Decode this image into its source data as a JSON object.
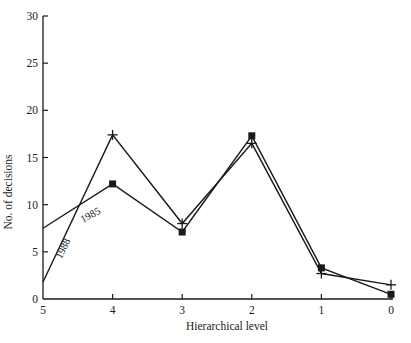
{
  "chart_data": {
    "type": "line",
    "title": "",
    "xlabel": "Hierarchical level",
    "ylabel": "No. of decisions",
    "x": [
      5,
      4,
      3,
      2,
      1,
      0
    ],
    "x_tick_labels": [
      "5",
      "4",
      "3",
      "2",
      "1",
      "0"
    ],
    "y_ticks": [
      0,
      5,
      10,
      15,
      20,
      25,
      30
    ],
    "ylim": [
      0,
      30
    ],
    "grid": false,
    "legend": "inline labels on lines",
    "series": [
      {
        "name": "1985",
        "marker": "square",
        "values": [
          7.5,
          12.2,
          7.1,
          17.3,
          3.3,
          0.5
        ]
      },
      {
        "name": "1988",
        "marker": "cross",
        "values": [
          1.8,
          17.4,
          8.0,
          16.5,
          2.7,
          1.5
        ]
      }
    ],
    "annotations": [
      {
        "text": "1985",
        "near_series": "1985",
        "position": "between levels 5 and 4"
      },
      {
        "text": "1988",
        "near_series": "1988",
        "position": "between levels 5 and 4"
      }
    ]
  }
}
